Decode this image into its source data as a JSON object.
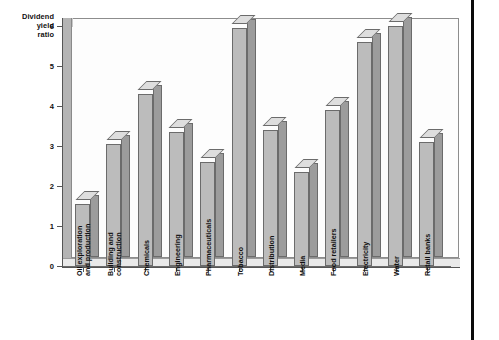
{
  "chart_data": {
    "type": "bar",
    "title": "",
    "subtitle": "",
    "ylabel": "Dividend yield ratio",
    "ylabel_lines": [
      "Dividend",
      "yield",
      "ratio"
    ],
    "xlabel": "",
    "ylim": [
      0,
      6
    ],
    "ytick_labels": [
      "0",
      "1",
      "2",
      "3",
      "4",
      "5",
      "6"
    ],
    "ytick_values": [
      0,
      1,
      2,
      3,
      4,
      5,
      6
    ],
    "grid": false,
    "legend": false,
    "legend_position": "none",
    "style": "3d-columns",
    "categories": [
      "Oil exploration and production",
      "Building and construction",
      "Chemicals",
      "Engineering",
      "Pharmaceuticals",
      "Tobacco",
      "Distribution",
      "Media",
      "Food retailers",
      "Electricity",
      "Water",
      "Retail banks"
    ],
    "category_lines": [
      [
        "Oil exploration",
        "and production"
      ],
      [
        "Building and",
        "construction"
      ],
      [
        "Chemicals",
        ""
      ],
      [
        "Engineering",
        ""
      ],
      [
        "Pharmaceuticals",
        ""
      ],
      [
        "Tobacco",
        ""
      ],
      [
        "Distribution",
        ""
      ],
      [
        "Media",
        ""
      ],
      [
        "Food retailers",
        ""
      ],
      [
        "Electricity",
        ""
      ],
      [
        "Water",
        ""
      ],
      [
        "Retail banks",
        ""
      ]
    ],
    "values": [
      1.55,
      3.05,
      4.3,
      3.35,
      2.6,
      5.95,
      3.4,
      2.35,
      3.9,
      5.6,
      6.0,
      3.1
    ],
    "colors": {
      "bar_front": "#bcbcbc",
      "bar_side": "#9c9c9c",
      "bar_top": "#dedede",
      "bar_outline": "#6b6b6b",
      "plot_background": "#fdfdfd",
      "wall": "#b4b4b4",
      "floor": "#e9e9e9",
      "axis": "#555555",
      "text": "#111111",
      "page_edge": "#0a0a0a"
    }
  }
}
